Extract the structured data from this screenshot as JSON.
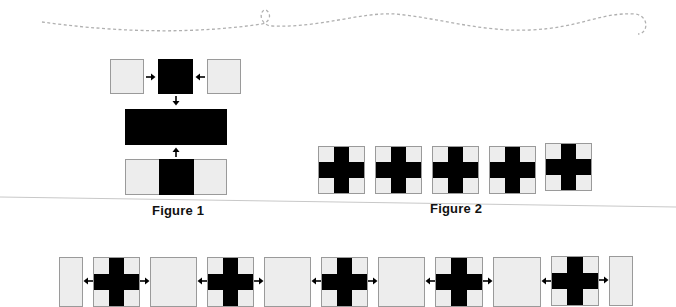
{
  "figures": [
    {
      "id": "figure-1",
      "caption": "Figure 1"
    },
    {
      "id": "figure-2",
      "caption": "Figure 2"
    }
  ],
  "colors": {
    "light_fill": "#ededed",
    "border": "#9a9a9a",
    "dark_fill": "#000000",
    "dashed_line": "#b0b0b0",
    "separator": "#c8c8c8"
  },
  "figure1": {
    "top_row": [
      "light-square",
      "arrow-right",
      "black-square",
      "arrow-left",
      "light-square"
    ],
    "middle": "black-rectangle",
    "bottom": [
      "light",
      "black",
      "light"
    ],
    "arrows": [
      "arrow-down",
      "arrow-up"
    ]
  },
  "figure2": {
    "tiles": [
      "cross",
      "cross",
      "cross",
      "cross",
      "cross"
    ]
  },
  "bottom_row": {
    "sequence": [
      "light-half",
      "arrow-left",
      "cross",
      "arrow-right",
      "light",
      "arrow-left",
      "cross",
      "arrow-right",
      "light",
      "arrow-left",
      "cross",
      "arrow-right",
      "light",
      "arrow-left",
      "cross",
      "arrow-right",
      "light",
      "arrow-left",
      "cross",
      "arrow-right",
      "light-half"
    ]
  }
}
